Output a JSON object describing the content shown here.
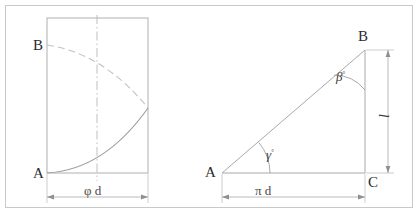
{
  "figure": {
    "title_visible": false,
    "frame_color": "#c9c9c9",
    "line_color": "#b9b9b9",
    "text_color": "#2b2b2b",
    "background": "#ffffff"
  },
  "left_panel": {
    "name": "developed-cylinder-rectangle",
    "points": {
      "A": {
        "label": "A",
        "x": 47,
        "y": 173
      },
      "B": {
        "label": "B",
        "x": 47,
        "y": 45
      }
    },
    "rectangle": {
      "x": 47,
      "y": 18,
      "width": 101,
      "height": 155
    },
    "centerline": {
      "label": "",
      "x": 97,
      "y1": 16,
      "y2": 181,
      "style": "dash-dot"
    },
    "solid_curve": {
      "name": "helix-lower-arc",
      "from": "A",
      "to_edge_y": 108
    },
    "dashed_curve": {
      "name": "helix-upper-arc",
      "from": "B",
      "to_edge_y": 108
    },
    "dimension": {
      "label": "φ d",
      "symbol": "phi-diameter",
      "x1": 47,
      "x2": 148,
      "y": 197
    }
  },
  "right_panel": {
    "name": "unrolled-helix-triangle",
    "points": {
      "A": {
        "label": "A",
        "x": 222,
        "y": 173
      },
      "B": {
        "label": "B",
        "x": 365,
        "y": 50
      },
      "C": {
        "label": "C",
        "x": 365,
        "y": 173
      }
    },
    "angles": [
      {
        "name": "angle-gamma-at-a",
        "label": "γ",
        "unit": "°",
        "vertex": "A",
        "radius": 48
      },
      {
        "name": "angle-beta-at-b",
        "label": "β",
        "unit": "°",
        "vertex": "B",
        "radius": 40
      }
    ],
    "dimensions": [
      {
        "name": "base-dimension",
        "label": "π d",
        "orientation": "horizontal",
        "x1": 222,
        "x2": 365,
        "y": 197
      },
      {
        "name": "height-dimension",
        "label": "l",
        "orientation": "vertical",
        "x": 388,
        "y1": 50,
        "y2": 173
      }
    ]
  }
}
